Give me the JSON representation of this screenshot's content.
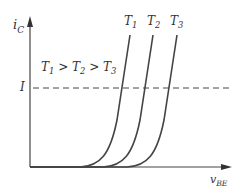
{
  "diagram": {
    "y_axis_label": {
      "main": "i",
      "sub": "C"
    },
    "x_axis_label": {
      "main": "v",
      "sub": "BE"
    },
    "relation_label": {
      "t1": "T",
      "s1": "1",
      "gt1": " > ",
      "t2": "T",
      "s2": "2",
      "gt2": " > ",
      "t3": "T",
      "s3": "3"
    },
    "current_level_label": "I",
    "curves": [
      {
        "label_main": "T",
        "label_sub": "1"
      },
      {
        "label_main": "T",
        "label_sub": "2"
      },
      {
        "label_main": "T",
        "label_sub": "3"
      }
    ],
    "colors": {
      "line": "#444444",
      "text": "#333333",
      "background": "#ffffff"
    }
  }
}
